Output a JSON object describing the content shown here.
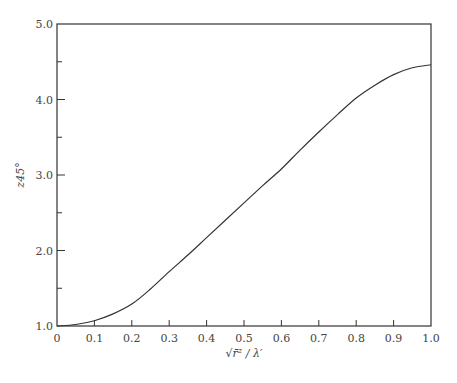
{
  "chart_data": {
    "type": "line",
    "title": "",
    "xlabel": "√r̄² / λ′",
    "ylabel": "z45°",
    "xlim": [
      0,
      1.0
    ],
    "ylim": [
      1.0,
      5.0
    ],
    "grid": false,
    "legend": null,
    "x_ticks": [
      "0",
      "0.1",
      "0.2",
      "0.3",
      "0.4",
      "0.5",
      "0.6",
      "0.7",
      "0.8",
      "0.9",
      "1.0"
    ],
    "y_ticks": [
      "1.0",
      "2.0",
      "3.0",
      "4.0",
      "5.0"
    ],
    "y_minor_ticks": [
      1.5,
      2.5,
      3.5,
      4.5
    ],
    "x": [
      0,
      0.05,
      0.1,
      0.15,
      0.2,
      0.25,
      0.3,
      0.35,
      0.4,
      0.45,
      0.5,
      0.55,
      0.6,
      0.65,
      0.7,
      0.75,
      0.8,
      0.85,
      0.9,
      0.95,
      1.0
    ],
    "series": [
      {
        "name": "z45°",
        "values": [
          1.0,
          1.02,
          1.07,
          1.16,
          1.29,
          1.49,
          1.72,
          1.94,
          2.17,
          2.4,
          2.63,
          2.86,
          3.08,
          3.33,
          3.57,
          3.8,
          4.02,
          4.19,
          4.33,
          4.42,
          4.46
        ]
      }
    ]
  }
}
